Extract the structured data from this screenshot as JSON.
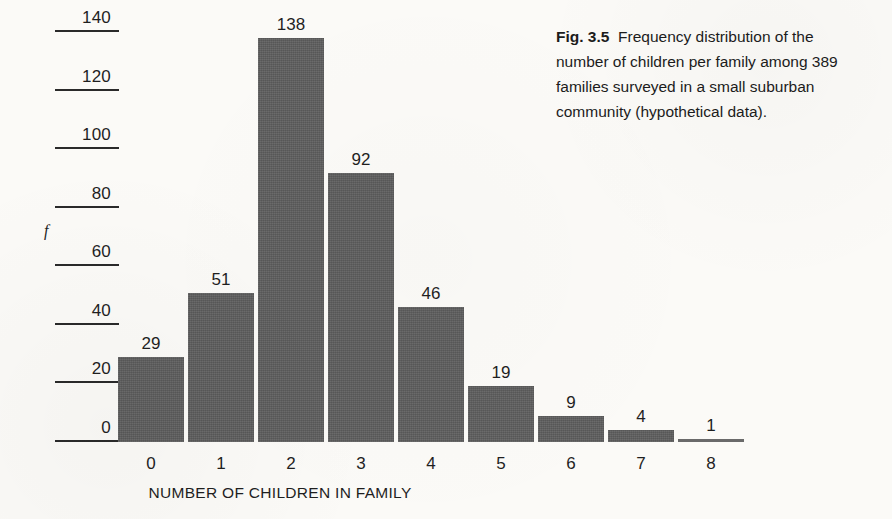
{
  "figure": {
    "label": "Fig. 3.5",
    "caption": "Frequency distribution of the number of children per family among 389 families surveyed in a small suburban community (hypothetical data)."
  },
  "chart_data": {
    "type": "bar",
    "title": "",
    "xlabel": "NUMBER OF CHILDREN IN FAMILY",
    "ylabel": "f",
    "categories": [
      "0",
      "1",
      "2",
      "3",
      "4",
      "5",
      "6",
      "7",
      "8"
    ],
    "values": [
      29,
      51,
      138,
      92,
      46,
      19,
      9,
      4,
      1
    ],
    "value_labels": [
      "29",
      "51",
      "138",
      "92",
      "46",
      "19",
      "9",
      "4",
      "1"
    ],
    "ylim": [
      0,
      140
    ],
    "yticks": [
      140,
      120,
      100,
      80,
      60,
      40,
      20,
      0
    ],
    "ytick_labels": [
      "140",
      "120",
      "100",
      "80",
      "60",
      "40",
      "20",
      "0"
    ],
    "grid": false,
    "legend": null,
    "bar_color": "#5e5e5e",
    "axis_color": "#2a2a2a",
    "background_color": "#fbfaf7",
    "total": 389
  }
}
